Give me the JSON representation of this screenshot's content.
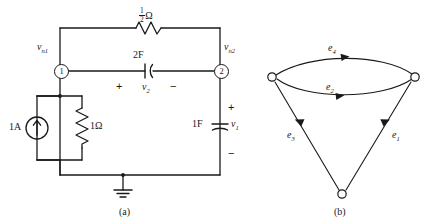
{
  "figure": {
    "panel_a": {
      "caption": "(a)",
      "nodes": [
        {
          "id": "1",
          "voltage_label": "v",
          "voltage_sub": "n1"
        },
        {
          "id": "2",
          "voltage_label": "v",
          "voltage_sub": "n2"
        }
      ],
      "components": [
        {
          "name": "top-resistor",
          "type": "resistor",
          "value_num": "1",
          "value_den": "2",
          "unit": "Ω"
        },
        {
          "name": "series-capacitor",
          "type": "capacitor",
          "value": "2F",
          "var_label": "v",
          "var_sub": "2",
          "plus": "+",
          "minus": "−"
        },
        {
          "name": "current-source",
          "type": "current-source",
          "value": "1A"
        },
        {
          "name": "shunt-resistor",
          "type": "resistor",
          "value": "1Ω"
        },
        {
          "name": "output-capacitor",
          "type": "capacitor",
          "value": "1F",
          "var_label": "v",
          "var_sub": "1",
          "plus": "+",
          "minus": "−"
        },
        {
          "name": "ground",
          "type": "ground"
        }
      ]
    },
    "panel_b": {
      "caption": "(b)",
      "nodes": [
        {
          "name": "graph-node-left"
        },
        {
          "name": "graph-node-right"
        },
        {
          "name": "graph-node-bottom"
        }
      ],
      "edges": [
        {
          "label": "e",
          "sub": "4",
          "name": "edge-e4",
          "from": "left",
          "to": "right",
          "shape": "upper-arc",
          "direction": "right"
        },
        {
          "label": "e",
          "sub": "2",
          "name": "edge-e2",
          "from": "left",
          "to": "right",
          "shape": "lower-arc",
          "direction": "right"
        },
        {
          "label": "e",
          "sub": "3",
          "name": "edge-e3",
          "from": "bottom",
          "to": "left",
          "shape": "straight",
          "direction": "up-left"
        },
        {
          "label": "e",
          "sub": "1",
          "name": "edge-e1",
          "from": "bottom",
          "to": "right",
          "shape": "straight",
          "direction": "up-right"
        }
      ]
    }
  },
  "colors": {
    "ink": "#1a1a1a",
    "background": "#ffffff"
  }
}
